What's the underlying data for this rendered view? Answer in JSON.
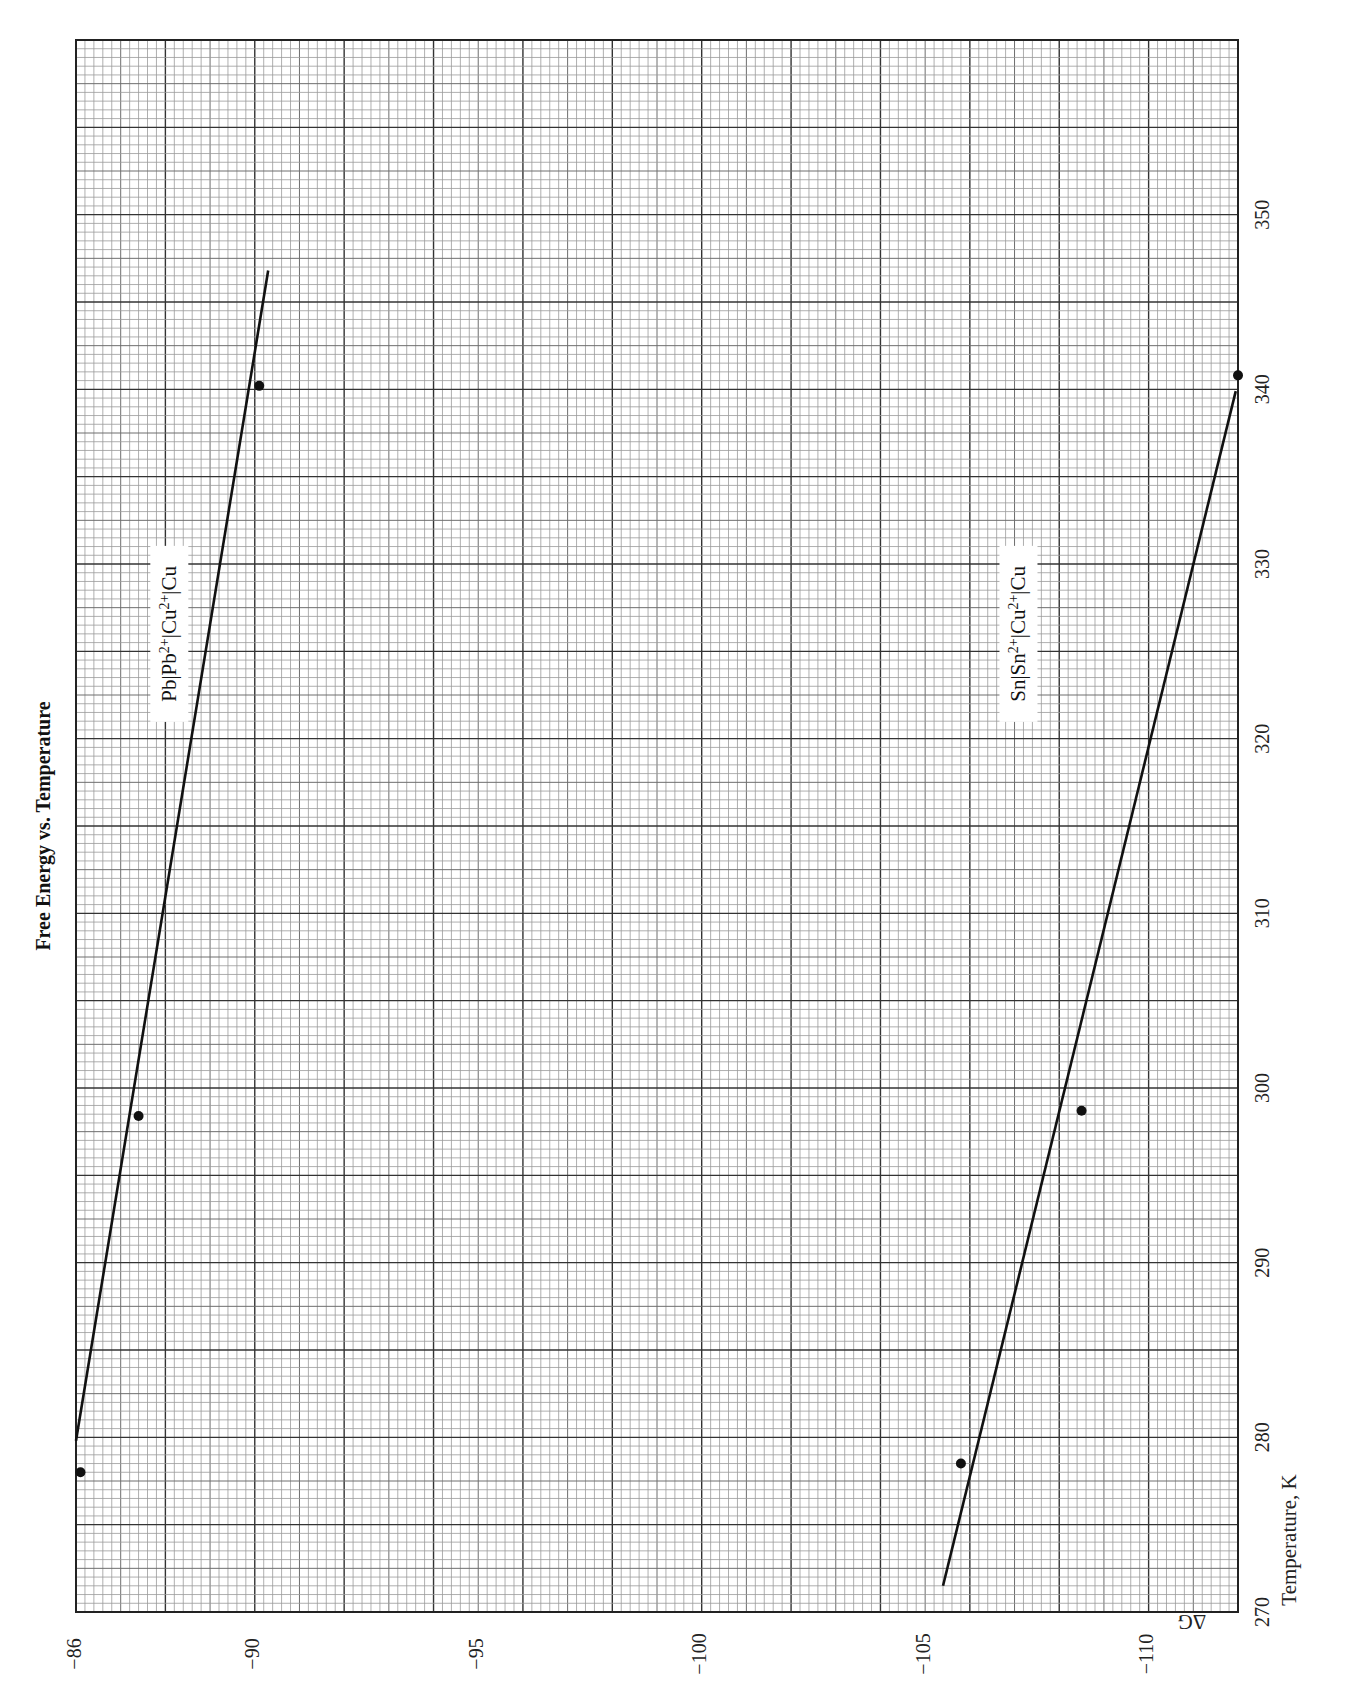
{
  "chart_data": {
    "type": "scatter",
    "title": "Free Energy vs. Temperature",
    "xlabel": "Temperature, K",
    "ylabel": "ΔG",
    "orientation_note_rotated": true,
    "xlim": [
      270,
      360
    ],
    "ylim": [
      -112,
      -86
    ],
    "x_ticks": [
      270,
      280,
      290,
      300,
      310,
      320,
      330,
      340,
      350
    ],
    "x_tick_labels": [
      "270",
      "280",
      "290",
      "300",
      "310",
      "320",
      "330",
      "340",
      "350"
    ],
    "y_ticks": [
      -86,
      -90,
      -95,
      -100,
      -105,
      -110
    ],
    "y_tick_labels": [
      "−86",
      "−90",
      "−95",
      "−100",
      "−105",
      "−110"
    ],
    "grid": true,
    "series": [
      {
        "name": "Pb|Pb²⁺|Cu²⁺|Cu",
        "label_base": "Pb|Pb",
        "label_sup1": "2+",
        "label_mid": "|Cu",
        "label_sup2": "2+",
        "label_end": "|Cu",
        "points": [
          {
            "T": 278.0,
            "dG": -86.1
          },
          {
            "T": 298.4,
            "dG": -87.4
          },
          {
            "T": 340.2,
            "dG": -90.1
          }
        ],
        "fit_line": {
          "T_start": 279.8,
          "dG_start": -86.0,
          "T_end": 346.8,
          "dG_end": -90.3
        },
        "label_pos": {
          "T": 326,
          "dG": -88.2
        }
      },
      {
        "name": "Sn|Sn²⁺|Cu²⁺|Cu",
        "label_base": "Sn|Sn",
        "label_sup1": "2+",
        "label_mid": "|Cu",
        "label_sup2": "2+",
        "label_end": "|Cu",
        "points": [
          {
            "T": 278.5,
            "dG": -105.8
          },
          {
            "T": 298.7,
            "dG": -108.5
          },
          {
            "T": 340.8,
            "dG": -112.0
          }
        ],
        "fit_line": {
          "T_start": 271.5,
          "dG_start": -105.4,
          "T_end": 339.9,
          "dG_end": -111.95
        },
        "label_pos": {
          "T": 326,
          "dG": -107.2
        }
      }
    ]
  },
  "corner_symbol": "ΔG"
}
